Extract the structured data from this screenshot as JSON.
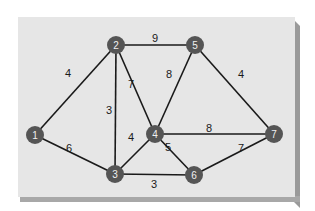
{
  "graph": {
    "nodes": [
      {
        "id": "1",
        "label": "1",
        "x": 35,
        "y": 135
      },
      {
        "id": "2",
        "label": "2",
        "x": 116,
        "y": 45
      },
      {
        "id": "3",
        "label": "3",
        "x": 115,
        "y": 174
      },
      {
        "id": "4",
        "label": "4",
        "x": 155,
        "y": 134
      },
      {
        "id": "5",
        "label": "5",
        "x": 195,
        "y": 45
      },
      {
        "id": "6",
        "label": "6",
        "x": 194,
        "y": 175
      },
      {
        "id": "7",
        "label": "7",
        "x": 274,
        "y": 134
      }
    ],
    "edges": [
      {
        "from": "1",
        "to": "2",
        "weight": "4",
        "lx": 68,
        "ly": 73
      },
      {
        "from": "1",
        "to": "3",
        "weight": "6",
        "lx": 69,
        "ly": 148
      },
      {
        "from": "2",
        "to": "5",
        "weight": "9",
        "lx": 155,
        "ly": 38
      },
      {
        "from": "2",
        "to": "3",
        "weight": "3",
        "lx": 109,
        "ly": 110
      },
      {
        "from": "2",
        "to": "4",
        "weight": "7",
        "lx": 131,
        "ly": 84
      },
      {
        "from": "5",
        "to": "4",
        "weight": "8",
        "lx": 169,
        "ly": 74
      },
      {
        "from": "5",
        "to": "7",
        "weight": "4",
        "lx": 241,
        "ly": 74
      },
      {
        "from": "4",
        "to": "7",
        "weight": "8",
        "lx": 209,
        "ly": 128
      },
      {
        "from": "4",
        "to": "3",
        "weight": "4",
        "lx": 131,
        "ly": 137
      },
      {
        "from": "4",
        "to": "6",
        "weight": "5",
        "lx": 168,
        "ly": 147
      },
      {
        "from": "3",
        "to": "6",
        "weight": "3",
        "lx": 154,
        "ly": 184
      },
      {
        "from": "7",
        "to": "6",
        "weight": "7",
        "lx": 241,
        "ly": 148
      }
    ]
  }
}
